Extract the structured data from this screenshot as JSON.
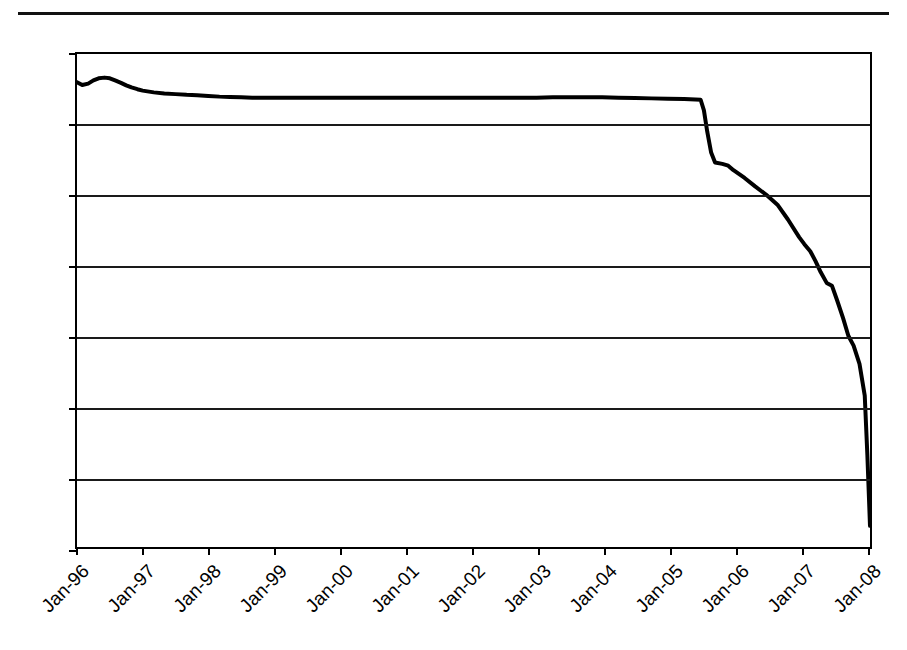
{
  "page": {
    "header_title_fragment": "Lend-Lease Residential Index",
    "background": "#ffffff"
  },
  "chart_data": {
    "type": "line",
    "title": "",
    "subtitle": "",
    "xlabel": "",
    "ylabel": "",
    "ylim": [
      7.0,
      8.4
    ],
    "yticks": [
      "7.0",
      "7.2",
      "7.4",
      "7.6",
      "7.8",
      "8.0",
      "8.2",
      "8.4"
    ],
    "ytick_values": [
      7.0,
      7.2,
      7.4,
      7.6,
      7.8,
      8.0,
      8.2,
      8.4
    ],
    "xticks": [
      "Jan-96",
      "Jan-97",
      "Jan-98",
      "Jan-99",
      "Jan-00",
      "Jan-01",
      "Jan-02",
      "Jan-03",
      "Jan-04",
      "Jan-05",
      "Jan-06",
      "Jan-07",
      "Jan-08"
    ],
    "xtick_values": [
      1996,
      1997,
      1998,
      1999,
      2000,
      2001,
      2002,
      2003,
      2004,
      2005,
      2006,
      2007,
      2008
    ],
    "xlim": [
      1996.0,
      2008.08
    ],
    "grid": "horizontal",
    "legend": "none",
    "line_color": "#000000",
    "line_width": 4,
    "series": [
      {
        "name": "series-1",
        "x": [
          1996.0,
          1996.08,
          1996.17,
          1996.25,
          1996.33,
          1996.42,
          1996.5,
          1996.58,
          1996.67,
          1996.75,
          1996.83,
          1996.92,
          1997.0,
          1997.17,
          1997.33,
          1997.5,
          1997.67,
          1997.83,
          1998.0,
          1998.17,
          1998.33,
          1998.5,
          1998.67,
          1998.83,
          1999.0,
          1999.25,
          1999.5,
          1999.75,
          2000.0,
          2000.25,
          2000.5,
          2000.75,
          2001.0,
          2001.25,
          2001.5,
          2001.75,
          2002.0,
          2002.25,
          2002.5,
          2002.75,
          2003.0,
          2003.25,
          2003.5,
          2003.75,
          2004.0,
          2004.25,
          2004.5,
          2004.75,
          2005.0,
          2005.25,
          2005.42,
          2005.5,
          2005.55,
          2005.6,
          2005.66,
          2005.72,
          2005.83,
          2005.92,
          2006.0,
          2006.17,
          2006.33,
          2006.5,
          2006.67,
          2006.83,
          2007.0,
          2007.08,
          2007.17,
          2007.25,
          2007.33,
          2007.42,
          2007.5,
          2007.58,
          2007.67,
          2007.75,
          2007.83,
          2007.92,
          2008.0,
          2008.04,
          2008.08
        ],
        "y": [
          8.32,
          8.312,
          8.316,
          8.325,
          8.331,
          8.333,
          8.331,
          8.325,
          8.318,
          8.311,
          8.305,
          8.3,
          8.296,
          8.291,
          8.288,
          8.286,
          8.284,
          8.283,
          8.281,
          8.279,
          8.278,
          8.277,
          8.276,
          8.276,
          8.276,
          8.276,
          8.276,
          8.276,
          8.276,
          8.276,
          8.276,
          8.276,
          8.276,
          8.276,
          8.276,
          8.276,
          8.276,
          8.276,
          8.276,
          8.276,
          8.276,
          8.277,
          8.277,
          8.277,
          8.277,
          8.276,
          8.275,
          8.274,
          8.273,
          8.272,
          8.271,
          8.27,
          8.24,
          8.18,
          8.12,
          8.092,
          8.088,
          8.083,
          8.07,
          8.048,
          8.024,
          8.0,
          7.972,
          7.93,
          7.88,
          7.86,
          7.84,
          7.812,
          7.78,
          7.75,
          7.742,
          7.7,
          7.65,
          7.6,
          7.572,
          7.52,
          7.43,
          7.26,
          7.06
        ]
      }
    ]
  }
}
